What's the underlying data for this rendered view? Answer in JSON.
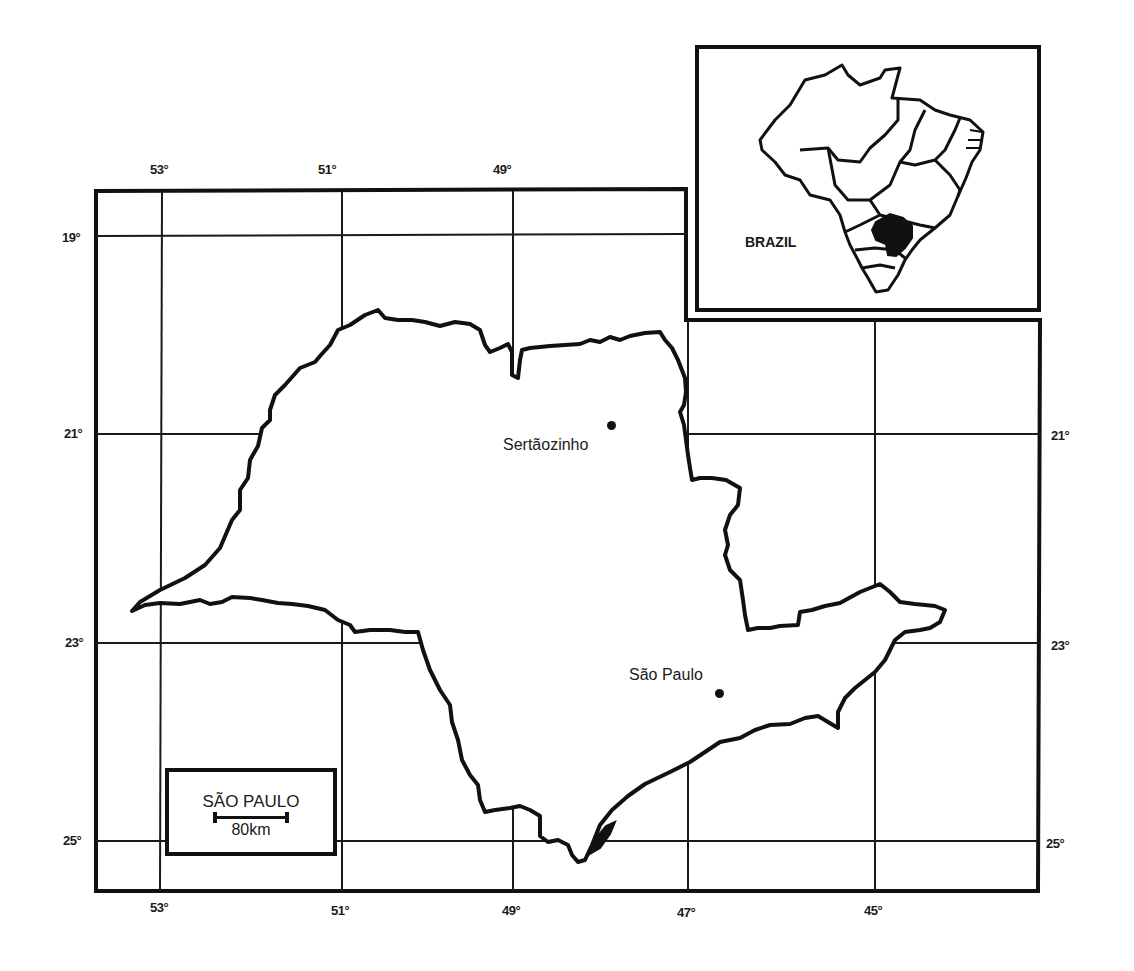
{
  "map": {
    "title": "São Paulo State, Brazil",
    "longitude_labels_top": [
      "53°",
      "51°",
      "49°"
    ],
    "longitude_labels_bottom": [
      "53°",
      "51°",
      "49°",
      "47°",
      "45°"
    ],
    "latitude_labels_left": [
      "19°",
      "21°",
      "23°",
      "25°"
    ],
    "latitude_labels_right": [
      "21°",
      "23°",
      "25°"
    ],
    "cities": [
      {
        "name": "Sertãozinho"
      },
      {
        "name": "São Paulo"
      }
    ],
    "legend": {
      "title": "SÃO PAULO",
      "scale": "80km"
    },
    "inset": {
      "label": "BRAZIL",
      "highlight_color": "#111111"
    }
  }
}
